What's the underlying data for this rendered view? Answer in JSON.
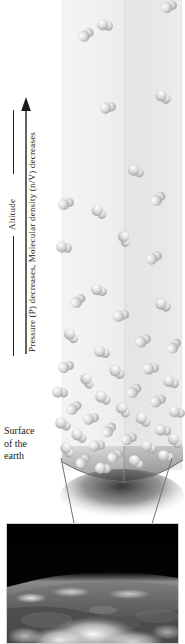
{
  "figure": {
    "background_color": "#ffffff"
  },
  "axis": {
    "altitude_label": "Altitude",
    "description_label": "Pressure (P) decreases, Molecular density (n/V) decreases",
    "arrow_direction": "up",
    "arrow_color": "#222222",
    "pressure_symbol": "P",
    "density_symbol": "n/V"
  },
  "surface_caption": {
    "line1": "Surface",
    "line2": "of the",
    "line3": "earth"
  },
  "column": {
    "face_left_color": "#f1f1ef",
    "face_right_color": "#e6e6e4",
    "edge_color": "#dedede",
    "ground_color": "#8f8f8f",
    "shadow_color": "#3a3a3a",
    "top_y": 0,
    "base_y": 470
  },
  "molecule_style": {
    "fill_light": "#ffffff",
    "fill_mid": "#d6d6d6",
    "fill_dark": "#8e8e8e",
    "shape": "diatomic-pair"
  },
  "molecules": [
    {
      "x": 166,
      "y": 6,
      "s": 11,
      "r": -22
    },
    {
      "x": 102,
      "y": 25,
      "s": 11,
      "r": 14
    },
    {
      "x": 83,
      "y": 34,
      "s": 11,
      "r": -35
    },
    {
      "x": 160,
      "y": 97,
      "s": 11,
      "r": 35
    },
    {
      "x": 105,
      "y": 107,
      "s": 11,
      "r": -12
    },
    {
      "x": 133,
      "y": 171,
      "s": 11,
      "r": 26
    },
    {
      "x": 63,
      "y": 203,
      "s": 11,
      "r": -18
    },
    {
      "x": 96,
      "y": 212,
      "s": 11,
      "r": 40
    },
    {
      "x": 155,
      "y": 198,
      "s": 11,
      "r": -42
    },
    {
      "x": 61,
      "y": 247,
      "s": 11,
      "r": 12
    },
    {
      "x": 121,
      "y": 239,
      "s": 11,
      "r": 72
    },
    {
      "x": 151,
      "y": 257,
      "s": 11,
      "r": -28
    },
    {
      "x": 96,
      "y": 290,
      "s": 11,
      "r": 20
    },
    {
      "x": 75,
      "y": 300,
      "s": 11,
      "r": -40
    },
    {
      "x": 160,
      "y": 305,
      "s": 11,
      "r": 30
    },
    {
      "x": 118,
      "y": 315,
      "s": 11,
      "r": -15
    },
    {
      "x": 68,
      "y": 336,
      "s": 11,
      "r": 48
    },
    {
      "x": 140,
      "y": 340,
      "s": 11,
      "r": -30
    },
    {
      "x": 99,
      "y": 352,
      "s": 11,
      "r": 18
    },
    {
      "x": 171,
      "y": 345,
      "s": 11,
      "r": -52
    },
    {
      "x": 63,
      "y": 366,
      "s": 11,
      "r": -20
    },
    {
      "x": 114,
      "y": 372,
      "s": 11,
      "r": 36
    },
    {
      "x": 148,
      "y": 368,
      "s": 11,
      "r": -10
    },
    {
      "x": 84,
      "y": 381,
      "s": 11,
      "r": 60
    },
    {
      "x": 168,
      "y": 382,
      "s": 11,
      "r": 22
    },
    {
      "x": 131,
      "y": 390,
      "s": 11,
      "r": -44
    },
    {
      "x": 57,
      "y": 392,
      "s": 11,
      "r": 8
    },
    {
      "x": 100,
      "y": 398,
      "s": 11,
      "r": 32
    },
    {
      "x": 155,
      "y": 400,
      "s": 11,
      "r": -26
    },
    {
      "x": 71,
      "y": 407,
      "s": 11,
      "r": -38
    },
    {
      "x": 120,
      "y": 410,
      "s": 11,
      "r": 52
    },
    {
      "x": 174,
      "y": 412,
      "s": 11,
      "r": 14
    },
    {
      "x": 88,
      "y": 418,
      "s": 11,
      "r": -16
    },
    {
      "x": 140,
      "y": 420,
      "s": 11,
      "r": 42
    },
    {
      "x": 60,
      "y": 424,
      "s": 11,
      "r": 28
    },
    {
      "x": 106,
      "y": 429,
      "s": 11,
      "r": -50
    },
    {
      "x": 160,
      "y": 430,
      "s": 11,
      "r": 10
    },
    {
      "x": 76,
      "y": 436,
      "s": 11,
      "r": 34
    },
    {
      "x": 126,
      "y": 438,
      "s": 11,
      "r": -24
    },
    {
      "x": 172,
      "y": 441,
      "s": 11,
      "r": 46
    },
    {
      "x": 94,
      "y": 445,
      "s": 11,
      "r": -8
    },
    {
      "x": 146,
      "y": 447,
      "s": 11,
      "r": 24
    },
    {
      "x": 64,
      "y": 450,
      "s": 11,
      "r": 56
    },
    {
      "x": 112,
      "y": 455,
      "s": 11,
      "r": -34
    },
    {
      "x": 163,
      "y": 456,
      "s": 11,
      "r": 16
    },
    {
      "x": 80,
      "y": 460,
      "s": 11,
      "r": -46
    },
    {
      "x": 133,
      "y": 462,
      "s": 11,
      "r": 38
    },
    {
      "x": 100,
      "y": 468,
      "s": 11,
      "r": 6
    }
  ],
  "leader_lines": [
    {
      "x1": 61,
      "y1": 458,
      "x2": 86,
      "y2": 583
    },
    {
      "x1": 172,
      "y1": 458,
      "x2": 135,
      "y2": 580
    }
  ],
  "earth_photo": {
    "alt": "Photograph of the curved limb of the earth with clouds viewed from orbit",
    "space_color": "#000000",
    "atmosphere_color": "#8a8a8a",
    "cloud_color": "#e8e8e8",
    "land_color": "#5a5a5a"
  }
}
